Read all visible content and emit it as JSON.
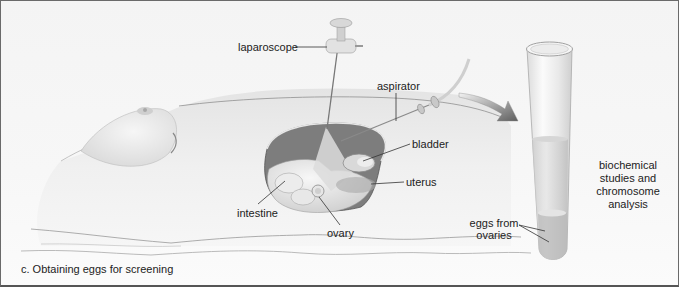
{
  "figure": {
    "caption": "c. Obtaining eggs for screening",
    "labels": {
      "laparoscope": "laparoscope",
      "aspirator": "aspirator",
      "bladder": "bladder",
      "uterus": "uterus",
      "intestine": "intestine",
      "ovary": "ovary",
      "eggs_line1": "eggs from",
      "eggs_line2": "ovaries",
      "analysis_line1": "biochemical",
      "analysis_line2": "studies and",
      "analysis_line3": "chromosome",
      "analysis_line4": "analysis"
    },
    "elements": [
      "reclining-torso",
      "abdominal-cavity-cutaway",
      "laparoscope-instrument",
      "aspirator-needle-and-tube",
      "curved-transfer-arrow",
      "collection-test-tube"
    ],
    "colors": {
      "skin": "#ececec",
      "cavity_dark": "#7d7d7d",
      "organ_light": "#e2e2e2",
      "arrow": "#6f6f6f",
      "label_text": "#222222",
      "leader_line": "#333333"
    }
  }
}
